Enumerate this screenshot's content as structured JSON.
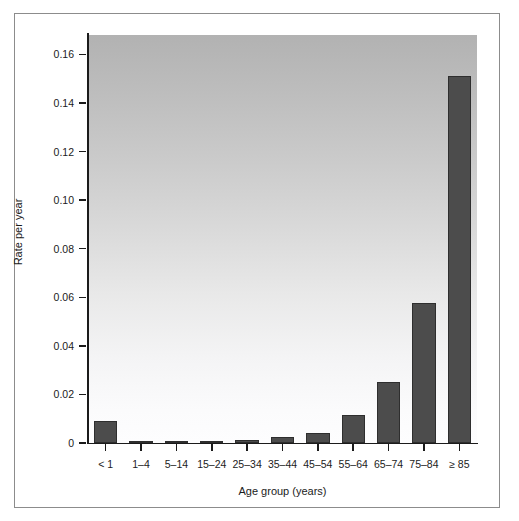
{
  "chart_data": {
    "type": "bar",
    "title": "",
    "subtitle": "",
    "xlabel": "Age group (years)",
    "ylabel": "Rate per year",
    "categories": [
      "< 1",
      "1–4",
      "5–14",
      "15–24",
      "25–34",
      "35–44",
      "45–54",
      "55–64",
      "65–74",
      "75–84",
      "≥ 85"
    ],
    "values": [
      0.009,
      0.0006,
      0.0004,
      0.0008,
      0.0014,
      0.0023,
      0.004,
      0.0117,
      0.0253,
      0.0575,
      0.151
    ],
    "ylim": [
      0,
      0.168
    ],
    "yticks": [
      0,
      0.02,
      0.04,
      0.06,
      0.08,
      0.1,
      0.12,
      0.14,
      0.16
    ],
    "ytick_labels": [
      "0",
      "0.02",
      "0.04",
      "0.06",
      "0.08",
      "0.10",
      "0.12",
      "0.14",
      "0.16"
    ],
    "grid": false,
    "legend": null,
    "legend_position": "none",
    "annotations": [],
    "colors": {
      "bar_fill": "#4c4c4c",
      "bar_outline": "#2e2e2e",
      "axis": "#1b1b1b",
      "panel_gradient_top": "#b2b2b2",
      "panel_gradient_bottom": "#fdfdfe",
      "figure_background": "#ffffff",
      "frame_border": "#8c8c8c"
    }
  }
}
